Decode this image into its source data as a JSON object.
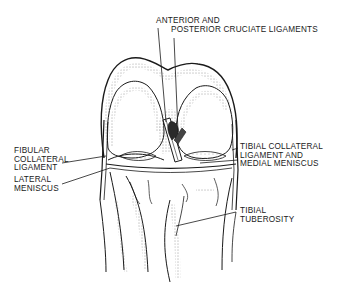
{
  "diagram": {
    "style": "black line-and-stipple anatomical illustration",
    "colors": {
      "ink": "#1a1a1a",
      "background": "#ffffff"
    },
    "labels": [
      {
        "id": "cruciate",
        "lines": [
          "ANTERIOR AND",
          "POSTERIOR CRUCIATE LIGAMENTS"
        ]
      },
      {
        "id": "fibular",
        "lines": [
          "FIBULAR",
          "COLLATERAL",
          "LIGAMENT"
        ]
      },
      {
        "id": "lateral-meniscus",
        "lines": [
          "LATERAL",
          "MENISCUS"
        ]
      },
      {
        "id": "tibial-collateral",
        "lines": [
          "TIBIAL COLLATERAL",
          "LIGAMENT AND",
          "MEDIAL MENISCUS"
        ]
      },
      {
        "id": "tuberosity",
        "lines": [
          "TIBIAL",
          "TUBEROSITY"
        ]
      }
    ]
  }
}
